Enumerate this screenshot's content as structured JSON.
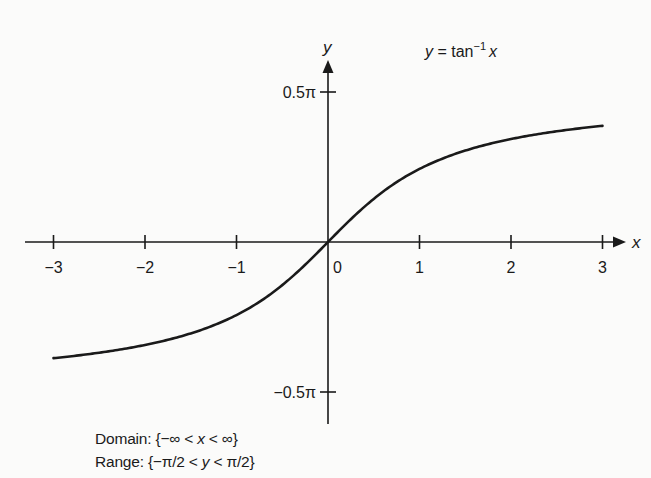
{
  "chart_data": {
    "type": "line",
    "title_parts": {
      "lhs": "y",
      "eq": " = tan",
      "sup": "−1",
      "arg": "x"
    },
    "xlabel": "x",
    "ylabel": "y",
    "xlim": [
      -3,
      3
    ],
    "ylim": [
      -1.5708,
      1.5708
    ],
    "grid": false,
    "x_ticks": [
      {
        "value": -3,
        "label": "−3"
      },
      {
        "value": -2,
        "label": "−2"
      },
      {
        "value": -1,
        "label": "−1"
      },
      {
        "value": 0,
        "label": "0"
      },
      {
        "value": 1,
        "label": "1"
      },
      {
        "value": 2,
        "label": "2"
      },
      {
        "value": 3,
        "label": "3"
      }
    ],
    "y_ticks": [
      {
        "value": 1.5708,
        "label": "0.5π"
      },
      {
        "value": -1.5708,
        "label": "−0.5π"
      }
    ],
    "series": [
      {
        "name": "y = arctan(x)",
        "x": [
          -3,
          -2.5,
          -2,
          -1.5,
          -1,
          -0.5,
          0,
          0.5,
          1,
          1.5,
          2,
          2.5,
          3
        ],
        "y": [
          -1.249,
          -1.19,
          -1.107,
          -0.983,
          -0.785,
          -0.464,
          0,
          0.464,
          0.785,
          0.983,
          1.107,
          1.19,
          1.249
        ]
      }
    ],
    "annotations": [
      {
        "label": "Domain",
        "text": "Domain: {−∞ < x < ∞}"
      },
      {
        "label": "Range",
        "text": "Range: {−π/2 < y < π/2}"
      }
    ]
  },
  "notes": {
    "domain_prefix": "Domain: {−∞ < ",
    "domain_var": "x",
    "domain_suffix": " < ∞}",
    "range_prefix": "Range: {−π/2 < ",
    "range_var": "y",
    "range_suffix": " < π/2}"
  },
  "colors": {
    "ink": "#1a1a1a",
    "background": "#fbfbfa"
  }
}
